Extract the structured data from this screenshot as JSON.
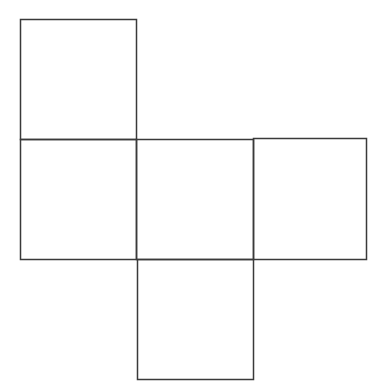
{
  "diagram": {
    "type": "cube-net",
    "stroke_color": "#3a3a3a",
    "background": "#ffffff",
    "faces": [
      {
        "id": "top",
        "x": 20,
        "y": 19,
        "w": 116,
        "h": 120
      },
      {
        "id": "left",
        "x": 20,
        "y": 139,
        "w": 116,
        "h": 120
      },
      {
        "id": "center",
        "x": 136,
        "y": 139,
        "w": 117,
        "h": 120
      },
      {
        "id": "right",
        "x": 253,
        "y": 138,
        "w": 113,
        "h": 121
      },
      {
        "id": "bottom",
        "x": 137,
        "y": 259,
        "w": 116,
        "h": 120
      }
    ]
  }
}
